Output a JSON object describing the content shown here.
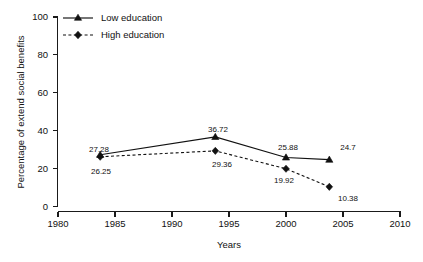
{
  "chart_data": {
    "type": "line",
    "title": "",
    "xlabel": "Years",
    "ylabel": "Percentage of extend social benefits",
    "xlim": [
      1980,
      2010
    ],
    "ylim": [
      0,
      100
    ],
    "xticks": [
      1980,
      1985,
      1990,
      1995,
      2000,
      2005,
      2010
    ],
    "yticks": [
      0,
      20,
      40,
      60,
      80,
      100
    ],
    "grid": false,
    "legend_position": "top-left",
    "x": [
      1983.7,
      1993.8,
      2000.0,
      2003.8
    ],
    "series": [
      {
        "name": "Low education",
        "marker": "triangle",
        "linestyle": "solid",
        "color": "#111111",
        "values": [
          27.28,
          36.72,
          25.88,
          24.7
        ],
        "labels": [
          "27.28",
          "36.72",
          "25.88",
          "24.7"
        ]
      },
      {
        "name": "High education",
        "marker": "diamond",
        "linestyle": "dashed",
        "color": "#111111",
        "values": [
          26.25,
          29.36,
          19.92,
          10.38
        ],
        "labels": [
          "26.25",
          "29.36",
          "19.92",
          "10.38"
        ]
      }
    ]
  },
  "axis": {
    "y_title": "Percentage of extend social benefits",
    "x_title": "Years",
    "y_tick_labels": [
      "0",
      "20",
      "40",
      "60",
      "80",
      "100"
    ],
    "x_tick_labels": [
      "1980",
      "1985",
      "1990",
      "1995",
      "2000",
      "2005",
      "2010"
    ]
  },
  "legend": {
    "items": [
      {
        "label": "Low education"
      },
      {
        "label": "High education"
      }
    ]
  },
  "point_labels": {
    "low": [
      "27.28",
      "36.72",
      "25.88",
      "24.7"
    ],
    "high": [
      "26.25",
      "29.36",
      "19.92",
      "10.38"
    ]
  }
}
